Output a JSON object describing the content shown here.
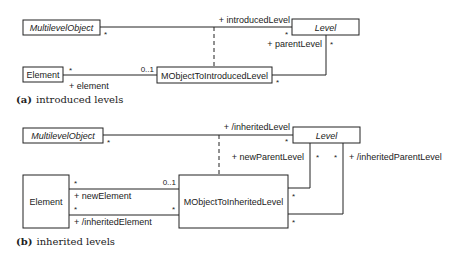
{
  "diagram_a": {
    "caption_label": "(a)",
    "caption_text": "introduced levels",
    "classes": {
      "multilevel_object": "MultilevelObject",
      "level": "Level",
      "element": "Element",
      "association_class": "MObjectToIntroducedLevel"
    },
    "roles": {
      "introduced_level": "+ introducedLevel",
      "parent_level": "+ parentLevel",
      "element": "+ element"
    },
    "multiplicities": {
      "mlo_end": "*",
      "level_end": "*",
      "level_parent_end": "*",
      "element_end": "*",
      "assoc_element_end": "0..1",
      "assoc_parent_end": "*"
    }
  },
  "diagram_b": {
    "caption_label": "(b)",
    "caption_text": "inherited levels",
    "classes": {
      "multilevel_object": "MultilevelObject",
      "level": "Level",
      "element": "Element",
      "association_class": "MObjectToInheritedLevel"
    },
    "roles": {
      "inherited_level": "+ /inheritedLevel",
      "new_parent_level": "+ newParentLevel",
      "inherited_parent_level": "+ /inheritedParentLevel",
      "new_element": "+ newElement",
      "inherited_element": "+ /inheritedElement"
    },
    "multiplicities": {
      "mlo_end": "*",
      "level_end": "*",
      "new_parent_level_end": "*",
      "inherited_parent_level_end": "*",
      "new_element_end": "*",
      "new_element_assoc_end": "0..1",
      "inherited_element_end": "*",
      "inherited_element_assoc_end": "*",
      "assoc_new_parent_end": "*",
      "assoc_inherited_parent_end": "*"
    }
  }
}
